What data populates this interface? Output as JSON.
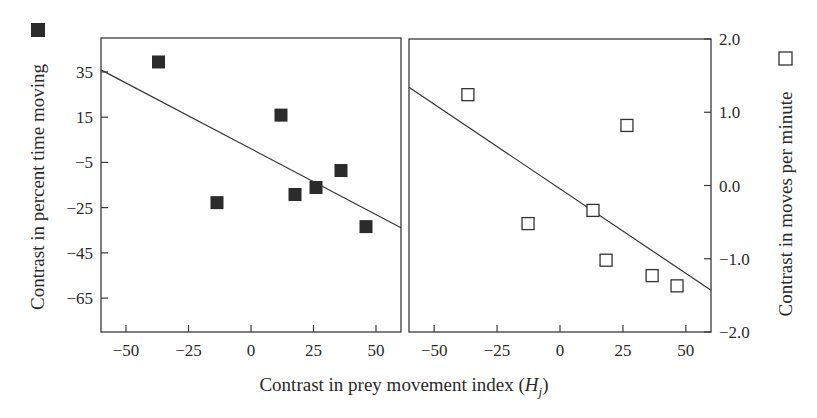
{
  "chart_data": [
    {
      "type": "scatter",
      "panel": "left",
      "title": "",
      "xlabel": "Contrast in prey movement index (H_j)",
      "ylabel": "Contrast in percent time moving",
      "legend_marker": "filled-square",
      "xlim": [
        -60,
        60
      ],
      "ylim": [
        -80,
        50
      ],
      "x_ticks": [
        -50,
        -25,
        0,
        25,
        50
      ],
      "x_tick_labels": [
        "−50",
        "−25",
        "0",
        "25",
        "50"
      ],
      "y_ticks": [
        35,
        15,
        -5,
        -25,
        -45,
        -65
      ],
      "y_tick_labels": [
        "35",
        "15",
        "−5",
        "−25",
        "−45",
        "−65"
      ],
      "grid": false,
      "points": [
        {
          "x": -37,
          "y": 39.4
        },
        {
          "x": -13.6,
          "y": -22.8
        },
        {
          "x": 12,
          "y": 15.9
        },
        {
          "x": 17.6,
          "y": -19.2
        },
        {
          "x": 26,
          "y": -16.1
        },
        {
          "x": 36,
          "y": -8.6
        },
        {
          "x": 46,
          "y": -33.4
        }
      ],
      "fit_line": {
        "x": [
          -60,
          60
        ],
        "y": [
          35.9,
          -33.9
        ]
      }
    },
    {
      "type": "scatter",
      "panel": "right",
      "title": "",
      "xlabel": "Contrast in prey movement index (H_j)",
      "ylabel": "Contrast in moves per minute",
      "legend_marker": "open-square",
      "xlim": [
        -60,
        60
      ],
      "ylim": [
        -2.0,
        2.0
      ],
      "x_ticks": [
        -50,
        -25,
        0,
        25,
        50
      ],
      "x_tick_labels": [
        "−50",
        "−25",
        "0",
        "25",
        "50"
      ],
      "y_ticks": [
        2.0,
        1.0,
        0.0,
        -1.0,
        -2.0
      ],
      "y_tick_labels": [
        "2.0",
        "1.0",
        "0.0",
        "−1.0",
        "−2.0"
      ],
      "y_axis_side": "right",
      "grid": false,
      "points": [
        {
          "x": -36.6,
          "y": 1.24
        },
        {
          "x": -12.7,
          "y": -0.52
        },
        {
          "x": 13.1,
          "y": -0.34
        },
        {
          "x": 18.3,
          "y": -1.02
        },
        {
          "x": 26.6,
          "y": 0.82
        },
        {
          "x": 36.6,
          "y": -1.23
        },
        {
          "x": 46.5,
          "y": -1.37
        }
      ],
      "fit_line": {
        "x": [
          -60,
          60
        ],
        "y": [
          1.34,
          -1.43
        ]
      }
    }
  ],
  "labels": {
    "x_label_main": "Contrast in prey movement index (",
    "x_label_var": "H",
    "x_label_sub": "j",
    "x_label_close": ")",
    "left_ylabel": "Contrast in percent time moving",
    "right_ylabel": "Contrast in moves per minute"
  },
  "colors": {
    "axis": "#3a3a3a",
    "marker_fill": "#2b2b2b",
    "text": "#2a2a2a",
    "background": "#ffffff"
  }
}
